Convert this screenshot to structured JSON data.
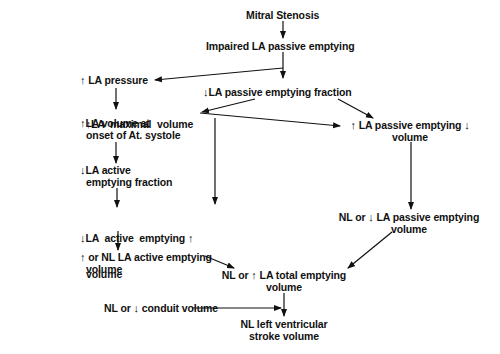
{
  "diagram": {
    "type": "flowchart",
    "nodes": {
      "mitral_stenosis": "Mitral Stenosis",
      "impaired_passive": "Impaired LA passive emptying",
      "la_pressure": {
        "prefix": "↑",
        "text": "LA pressure"
      },
      "passive_fraction": {
        "prefix": "↓",
        "text": "LA passive emptying fraction"
      },
      "la_max_volume": {
        "prefix": "↑",
        "text": "LA  maximal  volume"
      },
      "la_onset_volume": {
        "prefix": "↑",
        "line1": "LA volume at",
        "line2": "onset of At. systole"
      },
      "passive_volume_up": {
        "prefix": "↑",
        "line1": "LA passive emptying",
        "suffix": "↓",
        "line2": "volume"
      },
      "active_fraction": {
        "prefix": "↓",
        "line1": "LA active",
        "line2": "emptying fraction"
      },
      "active_volume": {
        "prefix": "↓",
        "line1": "LA  active  emptying",
        "suffix": "↑",
        "line2": "volume"
      },
      "passive_volume_nl": {
        "line1_a": "NL or ",
        "prefix": "↓",
        "line1_b": " LA passive emptying",
        "line2": "volume"
      },
      "active_volume_nl": {
        "prefix": "↑",
        "line1": " or NL LA active emptying",
        "line2": "volume"
      },
      "total_volume": {
        "line1_a": "NL or ",
        "prefix": "↑",
        "line1_b": " LA total emptying",
        "line2": "volume"
      },
      "conduit_volume": {
        "line_a": "NL or ",
        "prefix": "↓",
        "line_b": " conduit volume"
      },
      "lv_stroke_volume": {
        "line1": "NL left ventricular",
        "line2": "stroke volume"
      }
    },
    "edges": [
      [
        "mitral_stenosis",
        "impaired_passive"
      ],
      [
        "impaired_passive",
        "la_pressure"
      ],
      [
        "impaired_passive",
        "passive_fraction"
      ],
      [
        "la_pressure",
        "la_max_volume"
      ],
      [
        "passive_fraction",
        "la_max_volume"
      ],
      [
        "passive_fraction",
        "passive_volume_up"
      ],
      [
        "la_max_volume",
        "passive_volume_up"
      ],
      [
        "la_max_volume",
        "active_volume"
      ],
      [
        "la_onset_volume",
        "active_fraction"
      ],
      [
        "active_fraction",
        "active_volume"
      ],
      [
        "active_volume",
        "active_volume_nl"
      ],
      [
        "passive_volume_up",
        "passive_volume_nl"
      ],
      [
        "passive_volume_nl",
        "total_volume"
      ],
      [
        "active_volume_nl",
        "total_volume"
      ],
      [
        "total_volume",
        "lv_stroke_volume"
      ],
      [
        "conduit_volume",
        "lv_stroke_volume"
      ]
    ],
    "colors": {
      "text": "#111111",
      "arrow": "#111111",
      "background": "#ffffff"
    }
  }
}
